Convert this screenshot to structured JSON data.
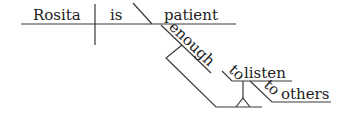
{
  "diagram": {
    "type": "sentence-diagram",
    "sentence": "Rosita is patient enough to listen to others",
    "words": {
      "subject": "Rosita",
      "verb": "is",
      "predicate_adjective": "patient",
      "modifier": "enough",
      "infinitive_prep": "to",
      "infinitive_verb": "listen",
      "prep": "to",
      "prep_object": "others"
    },
    "line_color": "#3a3a3a"
  }
}
